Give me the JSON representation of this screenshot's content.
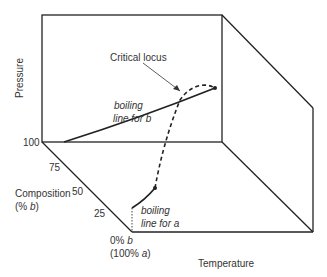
{
  "axes": {
    "pressure": "Pressure",
    "temperature": "Temperature",
    "composition_line1": "Composition",
    "composition_line2_prefix": "(% ",
    "composition_line2_var": "b",
    "composition_line2_suffix": ")"
  },
  "composition_ticks": [
    "100",
    "75",
    "50",
    "25"
  ],
  "origin_label": {
    "line1_prefix": "0% ",
    "line1_var": "b",
    "line2_prefix": "(100% ",
    "line2_var": "a",
    "line2_suffix": ")"
  },
  "annotations": {
    "critical_locus": "Critical locus",
    "boiling_b_line1": "boiling",
    "boiling_b_line2": "line for b",
    "boiling_a_line1": "boiling",
    "boiling_a_line2": "line for a"
  },
  "colors": {
    "line": "#222222",
    "text": "#333333"
  }
}
